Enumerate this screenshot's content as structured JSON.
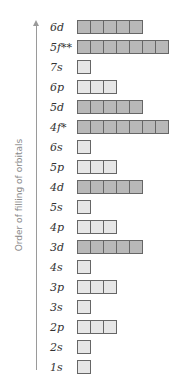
{
  "axis": {
    "label": "Order of filling of orbitals"
  },
  "colors": {
    "light": "#e6e6e6",
    "dark": "#b8b8b8",
    "border": "#666666"
  },
  "orbitals": [
    {
      "label": "6d",
      "boxes": 5,
      "shade": "dark"
    },
    {
      "label": "5f**",
      "boxes": 7,
      "shade": "dark"
    },
    {
      "label": "7s",
      "boxes": 1,
      "shade": "light"
    },
    {
      "label": "6p",
      "boxes": 3,
      "shade": "light"
    },
    {
      "label": "5d",
      "boxes": 5,
      "shade": "dark"
    },
    {
      "label": "4f*",
      "boxes": 7,
      "shade": "dark"
    },
    {
      "label": "6s",
      "boxes": 1,
      "shade": "light"
    },
    {
      "label": "5p",
      "boxes": 3,
      "shade": "light"
    },
    {
      "label": "4d",
      "boxes": 5,
      "shade": "dark"
    },
    {
      "label": "5s",
      "boxes": 1,
      "shade": "light"
    },
    {
      "label": "4p",
      "boxes": 3,
      "shade": "light"
    },
    {
      "label": "3d",
      "boxes": 5,
      "shade": "dark"
    },
    {
      "label": "4s",
      "boxes": 1,
      "shade": "light"
    },
    {
      "label": "3p",
      "boxes": 3,
      "shade": "light"
    },
    {
      "label": "3s",
      "boxes": 1,
      "shade": "light"
    },
    {
      "label": "2p",
      "boxes": 3,
      "shade": "light"
    },
    {
      "label": "2s",
      "boxes": 1,
      "shade": "light"
    },
    {
      "label": "1s",
      "boxes": 1,
      "shade": "light"
    }
  ]
}
